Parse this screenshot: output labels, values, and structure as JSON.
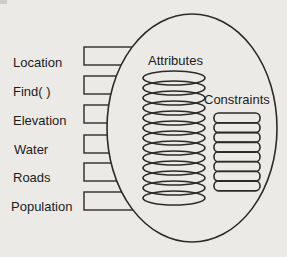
{
  "diagram": {
    "type": "object-encapsulation-diagram",
    "left_labels": [
      "Location",
      "Find( )",
      "Elevation",
      "Water",
      "Roads",
      "Population"
    ],
    "attributes_label": "Attributes",
    "constraints_label": "Constraints",
    "attributes_disc_count": 13,
    "constraints_disc_count": 8,
    "colors": {
      "background": "#ebeae6",
      "line": "#2b2b2b",
      "text": "#1c1c1c"
    }
  }
}
